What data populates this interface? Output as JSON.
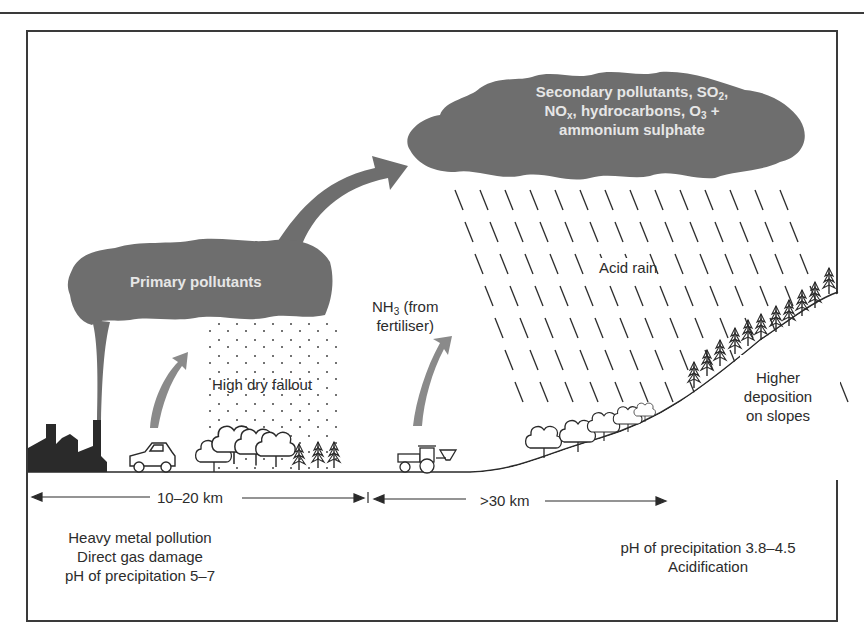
{
  "diagram": {
    "colors": {
      "cloud": "#6e6e6e",
      "ink": "#2a2a2a",
      "arrow": "#8a8a8a",
      "cloud_text": "#e6e6e6"
    },
    "clouds": {
      "primary": {
        "label": "Primary pollutants"
      },
      "secondary": {
        "line1_prefix": "Secondary pollutants, SO",
        "line1_sub": "2",
        "line1_suffix": ",",
        "line2_a": "NO",
        "line2_sub1": "x",
        "line2_b": ", hydrocarbons, O",
        "line2_sub2": "3",
        "line2_c": " +",
        "line3": "ammonium sulphate"
      }
    },
    "labels": {
      "dry_fallout": "High dry fallout",
      "nh3_prefix": "NH",
      "nh3_sub": "3",
      "nh3_suffix": " (from",
      "nh3_line2": "fertiliser)",
      "acid_rain": "Acid rain",
      "slopes_line1": "Higher",
      "slopes_line2": "deposition",
      "slopes_line3": "on slopes"
    },
    "distances": {
      "near": "10–20 km",
      "far": ">30 km"
    },
    "zones": {
      "near": [
        "Heavy metal pollution",
        "Direct gas damage",
        "pH of precipitation 5–7"
      ],
      "far": [
        "pH of  precipitation 3.8–4.5",
        "Acidification"
      ]
    },
    "icons": [
      "factory-icon",
      "car-icon",
      "deciduous-trees-icon",
      "conifer-trees-icon",
      "tractor-icon",
      "rain-icon",
      "upward-arrow-icon"
    ]
  }
}
